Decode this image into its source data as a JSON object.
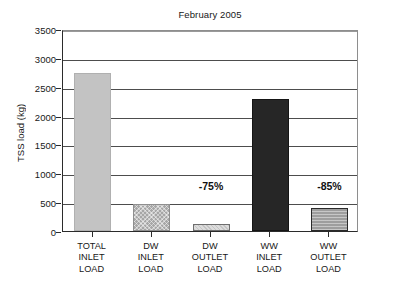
{
  "chart_data": {
    "type": "bar",
    "title": "February 2005",
    "xlabel": "",
    "ylabel": "TSS load (kg)",
    "ylim": [
      0,
      3500
    ],
    "ytick_step": 500,
    "yticks": [
      0,
      500,
      1000,
      1500,
      2000,
      2500,
      3000,
      3500
    ],
    "ytick_labels": [
      "0",
      "500",
      "1000",
      "1500",
      "2000",
      "2500",
      "3000",
      "3500"
    ],
    "grid": true,
    "grid_axis": "y",
    "legend": false,
    "legend_position": "none",
    "categories": [
      "TOTAL\nINLET\nLOAD",
      "DW\nINLET\nLOAD",
      "DW\nOUTLET\nLOAD",
      "WW\nINLET\nLOAD",
      "WW\nOUTLET\nLOAD"
    ],
    "category_lines": [
      [
        "TOTAL",
        "INLET",
        "LOAD"
      ],
      [
        "DW",
        "INLET",
        "LOAD"
      ],
      [
        "DW",
        "OUTLET",
        "LOAD"
      ],
      [
        "WW",
        "INLET",
        "LOAD"
      ],
      [
        "WW",
        "OUTLET",
        "LOAD"
      ]
    ],
    "values": [
      2740,
      470,
      130,
      2280,
      400
    ],
    "bar_colors": [
      "#c3c3c3",
      "#a6a6a6",
      "#dcdcdc",
      "#262626",
      "#9e9e9e"
    ],
    "bar_borders": [
      "#b0b0b0",
      "#8f8f8f",
      "#6e6e6e",
      "#151515",
      "#2a2a2a"
    ],
    "annotations": [
      {
        "text": "-75%",
        "category_index": 2,
        "value": 800
      },
      {
        "text": "-85%",
        "category_index": 4,
        "value": 800
      }
    ]
  },
  "figure": {
    "background": "#ffffff",
    "axis_color": "#2b2b2b",
    "gridline_color": "#4d4d4d",
    "text_color": "#181818"
  }
}
